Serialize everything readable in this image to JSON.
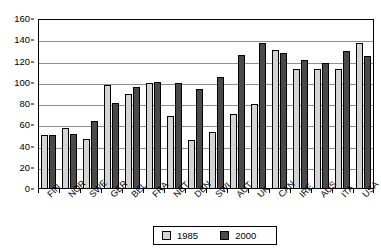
{
  "chart_data": {
    "type": "bar",
    "title": "",
    "xlabel": "",
    "ylabel": "",
    "ylim": [
      0,
      160
    ],
    "ytick_step": 20,
    "yticks": [
      "0",
      "20",
      "40",
      "60",
      "80",
      "100",
      "120",
      "140",
      "160"
    ],
    "grid": true,
    "legend_position": "bottom",
    "categories": [
      "FIN",
      "NOR",
      "SWE",
      "GER",
      "BEL",
      "FRA",
      "NET",
      "DEN",
      "SWI",
      "AUT",
      "UK",
      "CAN",
      "IRE",
      "AUS",
      "ITA",
      "USA"
    ],
    "series": [
      {
        "name": "1985",
        "color": "#d4d4d4",
        "values": [
          51,
          57,
          47,
          98,
          89,
          100,
          69,
          46,
          54,
          71,
          80,
          131,
          113,
          113,
          113,
          137
        ]
      },
      {
        "name": "2000",
        "color": "#4a4a4a",
        "values": [
          51,
          52,
          64,
          81,
          96,
          101,
          100,
          94,
          105,
          126,
          137,
          128,
          121,
          119,
          130,
          125
        ]
      }
    ]
  },
  "legend": {
    "entries": [
      {
        "label": "1985"
      },
      {
        "label": "2000"
      }
    ]
  }
}
